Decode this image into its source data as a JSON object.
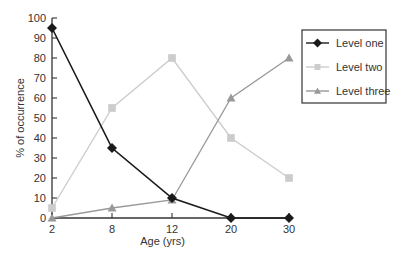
{
  "chart_data": {
    "type": "line",
    "title": "",
    "xlabel": "Age (yrs)",
    "ylabel": "% of occurrence",
    "categories": [
      "2",
      "8",
      "12",
      "20",
      "30"
    ],
    "x": [
      2,
      8,
      12,
      20,
      30
    ],
    "ylim": [
      0,
      100
    ],
    "yticks": [
      0,
      10,
      20,
      30,
      40,
      50,
      60,
      70,
      80,
      90,
      100
    ],
    "grid": false,
    "legend_position": "upper right (outside plot area)",
    "series": [
      {
        "name": "Level one",
        "marker": "diamond",
        "color": "#1a1a1a",
        "values": [
          95,
          35,
          10,
          0,
          0
        ]
      },
      {
        "name": "Level two",
        "marker": "square",
        "color": "#cccccc",
        "values": [
          5,
          55,
          80,
          40,
          20
        ]
      },
      {
        "name": "Level three",
        "marker": "triangle",
        "color": "#999999",
        "values": [
          0,
          5,
          9,
          60,
          80
        ]
      }
    ]
  },
  "legend": {
    "items": [
      {
        "label": "Level one"
      },
      {
        "label": "Level two"
      },
      {
        "label": "Level three"
      }
    ]
  }
}
